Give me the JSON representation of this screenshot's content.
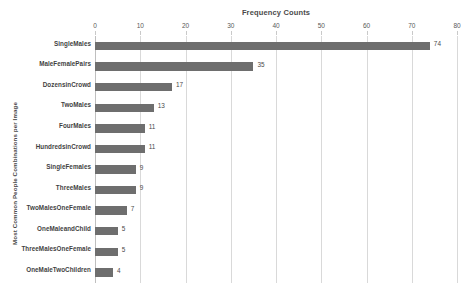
{
  "chart_data": {
    "type": "bar",
    "orientation": "horizontal",
    "title": "Frequency Counts",
    "xlabel": "",
    "ylabel": "Most Common People Combinations per Image",
    "xlim": [
      0,
      80
    ],
    "xticks": [
      0,
      10,
      20,
      30,
      40,
      50,
      60,
      70,
      80
    ],
    "grid": true,
    "legend": false,
    "bar_color": "#6e6e6e",
    "gridline_color": "#d9d9d9",
    "background_color": "#ffffff",
    "categories": [
      "SingleMales",
      "MaleFemalePairs",
      "DozensinCrowd",
      "TwoMales",
      "FourMales",
      "HundredsinCrowd",
      "SingleFemales",
      "ThreeMales",
      "TwoMalesOneFemale",
      "OneMaleandChild",
      "ThreeMalesOneFemale",
      "OneMaleTwoChildren"
    ],
    "values": [
      74,
      35,
      17,
      13,
      11,
      11,
      9,
      9,
      7,
      5,
      5,
      4
    ],
    "data_labels": [
      "74",
      "35",
      "17",
      "13",
      "11",
      "11",
      "9",
      "9",
      "7",
      "5",
      "5",
      "4"
    ]
  }
}
